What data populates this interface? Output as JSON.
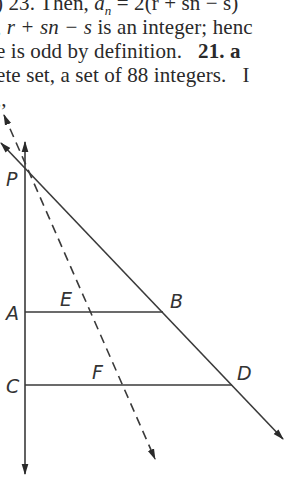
{
  "text": {
    "line1": {
      "prefix": ") 23. Then, ",
      "a": "a",
      "sub": "n",
      "rest": " = 2(r + sn − s)"
    },
    "line2": {
      "start": ", ",
      "expr": "r + sn − s",
      "rest": " is an integer; henc"
    },
    "line3": {
      "start": "e is odd by definition.   ",
      "num": "21.",
      "tail": " a"
    },
    "line4": {
      "text": "ete set, a set of 88 integers.   I"
    },
    "line5": {
      "text": ",,"
    }
  },
  "figure": {
    "labels": {
      "P": "P",
      "A": "A",
      "B": "B",
      "C": "C",
      "D": "D",
      "E": "E",
      "F": "F"
    },
    "colors": {
      "stroke": "#3a3a3a",
      "label": "#333333"
    },
    "points": {
      "P": [
        25,
        171
      ],
      "A": [
        25,
        312
      ],
      "B": [
        163,
        312
      ],
      "C": [
        25,
        385
      ],
      "D": [
        232,
        385
      ],
      "E": [
        91,
        312
      ],
      "F": [
        123,
        385
      ]
    }
  }
}
